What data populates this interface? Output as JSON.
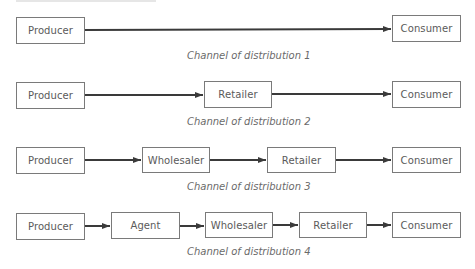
{
  "channels": [
    {
      "caption": "Channel of distribution 1",
      "nodes": [
        "Producer",
        "Consumer"
      ]
    },
    {
      "caption": "Channel of distribution 2",
      "nodes": [
        "Producer",
        "Retailer",
        "Consumer"
      ]
    },
    {
      "caption": "Channel of distribution 3",
      "nodes": [
        "Producer",
        "Wholesaler",
        "Retailer",
        "Consumer"
      ]
    },
    {
      "caption": "Channel of distribution 4",
      "nodes": [
        "Producer",
        "Agent",
        "Wholesaler",
        "Retailer",
        "Consumer"
      ]
    }
  ],
  "colors": {
    "box_border": "#7a7a7a",
    "arrow": "#3a3a3a",
    "text": "#5a5a5a"
  }
}
